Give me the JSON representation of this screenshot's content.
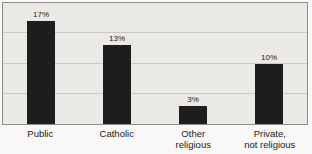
{
  "chart_data": {
    "type": "bar",
    "categories": [
      "Public",
      "Catholic",
      "Other\nreligious",
      "Private,\nnot religious"
    ],
    "values": [
      17,
      13,
      3,
      10
    ],
    "value_labels": [
      "17%",
      "13%",
      "3%",
      "10%"
    ],
    "title": "",
    "xlabel": "",
    "ylabel": "",
    "ylim": [
      0,
      20
    ],
    "gridline_interval": 5,
    "grid": true,
    "legend": "none",
    "colors": {
      "bar": "#1d1d1d",
      "plot_background": "#eae9e5",
      "gridline": "#c9c8c4",
      "border": "#8c8c8a",
      "label_text": "#1a1a1a"
    }
  }
}
